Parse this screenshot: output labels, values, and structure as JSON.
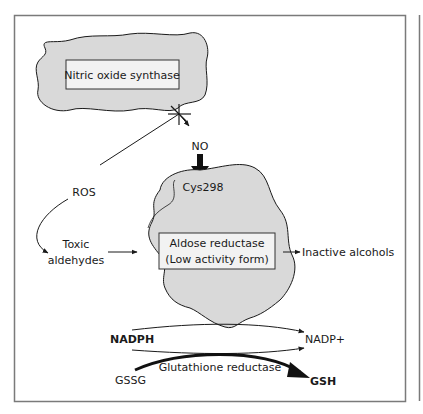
{
  "diagram": {
    "nodes": {
      "nos": "Nitric oxide synthase",
      "no": "NO",
      "cys": "Cys298",
      "ros": "ROS",
      "toxic_1": "Toxic",
      "toxic_2": "aldehydes",
      "ar_1": "Aldose reductase",
      "ar_2": "(Low activity form)",
      "inactive": "Inactive alcohols",
      "nadph": "NADPH",
      "nadp": "NADP+",
      "gssg": "GSSG",
      "gr": "Glutathione reductase",
      "gsh": "GSH"
    },
    "colors": {
      "blob_fill": "#d9d9d9",
      "box_fill": "#f2f2f2",
      "stroke": "#1a1a1a",
      "frame": "#808080"
    }
  }
}
